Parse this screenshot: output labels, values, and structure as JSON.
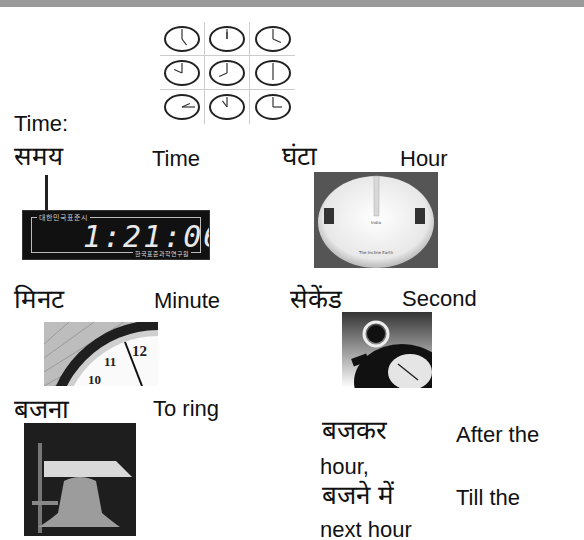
{
  "header": {
    "bar_color": "#9a9a9a"
  },
  "intro": {
    "label": "Time:"
  },
  "vocab": [
    {
      "hindi": "समय",
      "english": "Time"
    },
    {
      "hindi": "घंटा",
      "english": "Hour"
    },
    {
      "hindi": "मिनट",
      "english": "Minute"
    },
    {
      "hindi": "सेकेंड",
      "english": "Second"
    },
    {
      "hindi": "बजना",
      "english": "To ring"
    },
    {
      "hindi": "बजकर",
      "english": "After the hour,"
    },
    {
      "hindi": "बजने में",
      "english": "Till the next hour"
    }
  ],
  "illustrations": {
    "clock_grid": {
      "description": "3x3 grid of analog clocks"
    },
    "digital_clock": {
      "display": "1:21:06",
      "top_label": "대한민국표준시",
      "brand": "한국표준과학연구원"
    },
    "sundial_labels": {
      "center": "India",
      "bottom": "The Incline Earth"
    },
    "minute_clock_numbers": [
      "10",
      "11",
      "12"
    ]
  }
}
